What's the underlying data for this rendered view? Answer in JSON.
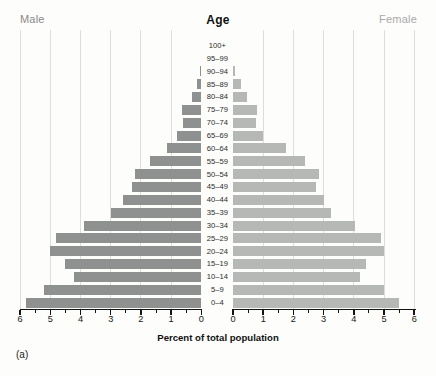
{
  "header": {
    "male_label": "Male",
    "age_label": "Age",
    "female_label": "Female"
  },
  "axis": {
    "male_ticks": [
      "6",
      "5",
      "4",
      "3",
      "2",
      "1",
      "0"
    ],
    "female_ticks": [
      "0",
      "1",
      "2",
      "3",
      "4",
      "5",
      "6"
    ],
    "xlabel": "Percent of total population"
  },
  "footnote": "(a)",
  "colors": {
    "male_bar": "#8e918f",
    "female_bar": "#b5b8b5",
    "gridline": "#deded9",
    "male_header_text": "#8a8a8a",
    "female_header_text": "#a9a9a9"
  },
  "chart_data": {
    "type": "bar",
    "subtype": "population-pyramid",
    "title": "Age",
    "xlabel": "Percent of total population",
    "x_range_percent": [
      0,
      6
    ],
    "gridlines_percent": [
      1,
      2,
      3,
      4,
      5,
      6
    ],
    "minor_tick_step": 0.5,
    "legend_position": "none",
    "age_groups": [
      "100+",
      "95–99",
      "90–94",
      "85–89",
      "80–84",
      "75–79",
      "70–74",
      "65–69",
      "60–64",
      "55–59",
      "50–54",
      "45–49",
      "40–44",
      "35–39",
      "30–34",
      "25–29",
      "20–24",
      "15–19",
      "10–14",
      "5–9",
      "0–4"
    ],
    "series": [
      {
        "name": "Male",
        "side": "left",
        "values": [
          0,
          0,
          0.05,
          0.15,
          0.3,
          0.65,
          0.6,
          0.8,
          1.15,
          1.7,
          2.2,
          2.3,
          2.6,
          3.0,
          3.9,
          4.8,
          5.0,
          4.5,
          4.2,
          5.2,
          5.8
        ]
      },
      {
        "name": "Female",
        "side": "right",
        "values": [
          0,
          0,
          0.07,
          0.25,
          0.45,
          0.8,
          0.75,
          1.0,
          1.75,
          2.4,
          2.85,
          2.75,
          3.0,
          3.25,
          4.05,
          4.9,
          5.0,
          4.4,
          4.2,
          5.0,
          5.5
        ]
      }
    ]
  }
}
